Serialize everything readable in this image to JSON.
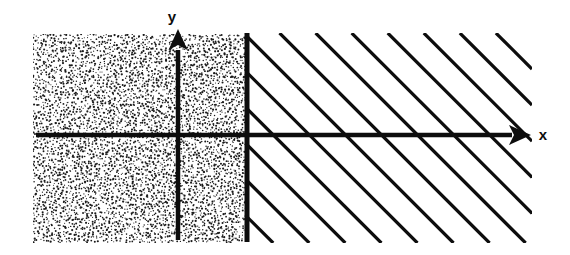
{
  "figure": {
    "name": "coordinate-plane-region-diagram",
    "background_color": "#ffffff",
    "ink_color": "#0d0d0d",
    "width": 570,
    "height": 255
  },
  "axes": {
    "x_axis": {
      "label": "x",
      "label_x": 543,
      "label_y": 140,
      "line_y": 135,
      "line_x_start": 36,
      "line_x_end": 512,
      "arrow_tip_x": 531,
      "arrow_head_length": 22,
      "arrow_head_width": 20,
      "stroke_width": 4.5,
      "direction": "right"
    },
    "y_axis": {
      "label": "y",
      "label_x": 172,
      "label_y": 22,
      "line_x": 178,
      "line_y_start": 240,
      "line_y_end": 50,
      "arrow_tip_y": 29,
      "arrow_head_length": 21,
      "arrow_head_width": 19,
      "stroke_width": 4.5,
      "direction": "up"
    }
  },
  "boundary_line": {
    "name": "vertical-boundary-line",
    "x": 247,
    "y_top": 33,
    "y_bottom": 242,
    "stroke_width": 5,
    "style": "solid"
  },
  "regions": {
    "stippled_region": {
      "name": "stippled-region-left",
      "fill_style": "random-dot-stipple",
      "x": 33,
      "y": 34,
      "width": 214,
      "height": 209,
      "dot_count": 5200,
      "dot_radius": 0.85,
      "dot_color": "#1a1a1a",
      "description": "shaded half plane left of boundary"
    },
    "hatched_region": {
      "name": "hatched-region-right",
      "fill_style": "diagonal-hatch",
      "x": 247,
      "y": 33,
      "width": 285,
      "height": 210,
      "hatch_angle_deg": -45,
      "hatch_spacing": 25.5,
      "hatch_stroke_width": 3.2,
      "hatch_color": "#0d0d0d",
      "description": "hatched half plane right of boundary"
    }
  }
}
